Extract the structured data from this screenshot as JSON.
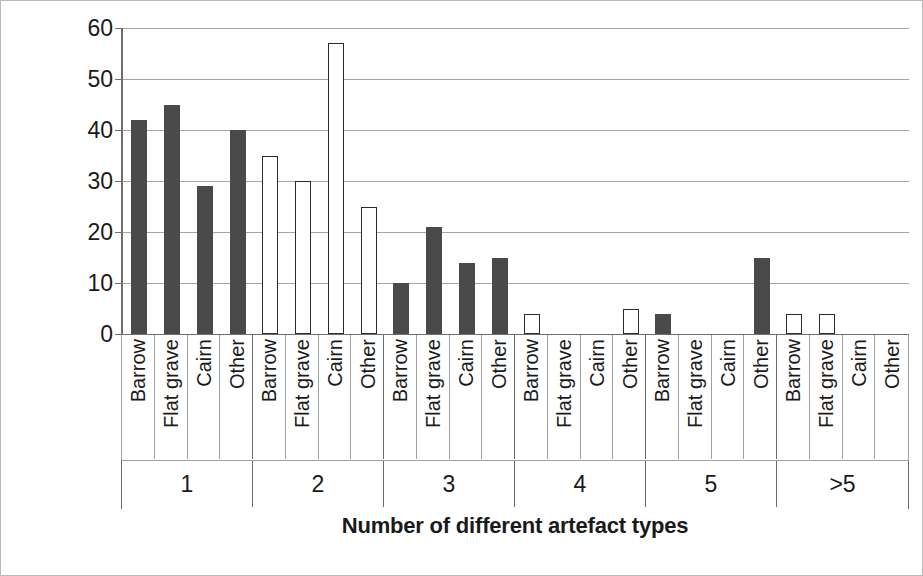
{
  "chart_data": {
    "type": "bar",
    "title": "",
    "xlabel": "Number of different artefact types",
    "ylabel": "Percentage of burials",
    "ylim": [
      0,
      60
    ],
    "yticks": [
      0,
      10,
      20,
      30,
      40,
      50,
      60
    ],
    "ytick_labels": [
      "0",
      "10",
      "20",
      "30",
      "40",
      "50",
      "60"
    ],
    "grid": true,
    "legend": "none",
    "groups": [
      "1",
      "2",
      "3",
      "4",
      "5",
      ">5"
    ],
    "categories": [
      "Barrow",
      "Flat grave",
      "Cairn",
      "Other"
    ],
    "colors": {
      "filled": "#4a4a4a",
      "open_fill": "#ffffff",
      "open_stroke": "#2b2b2b",
      "gridline": "#a6a6a6",
      "axis": "#6f6f6f",
      "text": "#1a1a1a"
    },
    "bars": [
      {
        "group": "1",
        "category": "Barrow",
        "value": 42,
        "style": "filled"
      },
      {
        "group": "1",
        "category": "Flat grave",
        "value": 45,
        "style": "filled"
      },
      {
        "group": "1",
        "category": "Cairn",
        "value": 29,
        "style": "filled"
      },
      {
        "group": "1",
        "category": "Other",
        "value": 40,
        "style": "filled"
      },
      {
        "group": "2",
        "category": "Barrow",
        "value": 35,
        "style": "open"
      },
      {
        "group": "2",
        "category": "Flat grave",
        "value": 30,
        "style": "open"
      },
      {
        "group": "2",
        "category": "Cairn",
        "value": 57,
        "style": "open"
      },
      {
        "group": "2",
        "category": "Other",
        "value": 25,
        "style": "open"
      },
      {
        "group": "3",
        "category": "Barrow",
        "value": 10,
        "style": "filled"
      },
      {
        "group": "3",
        "category": "Flat grave",
        "value": 21,
        "style": "filled"
      },
      {
        "group": "3",
        "category": "Cairn",
        "value": 14,
        "style": "filled"
      },
      {
        "group": "3",
        "category": "Other",
        "value": 15,
        "style": "filled"
      },
      {
        "group": "4",
        "category": "Barrow",
        "value": 4,
        "style": "open"
      },
      {
        "group": "4",
        "category": "Flat grave",
        "value": 0,
        "style": "open"
      },
      {
        "group": "4",
        "category": "Cairn",
        "value": 0,
        "style": "open"
      },
      {
        "group": "4",
        "category": "Other",
        "value": 5,
        "style": "open"
      },
      {
        "group": "5",
        "category": "Barrow",
        "value": 4,
        "style": "filled"
      },
      {
        "group": "5",
        "category": "Flat grave",
        "value": 0,
        "style": "filled"
      },
      {
        "group": "5",
        "category": "Cairn",
        "value": 0,
        "style": "filled"
      },
      {
        "group": "5",
        "category": "Other",
        "value": 15,
        "style": "filled"
      },
      {
        "group": ">5",
        "category": "Barrow",
        "value": 4,
        "style": "open"
      },
      {
        "group": ">5",
        "category": "Flat grave",
        "value": 4,
        "style": "open"
      },
      {
        "group": ">5",
        "category": "Cairn",
        "value": 0,
        "style": "open"
      },
      {
        "group": ">5",
        "category": "Other",
        "value": 0,
        "style": "open"
      }
    ]
  }
}
